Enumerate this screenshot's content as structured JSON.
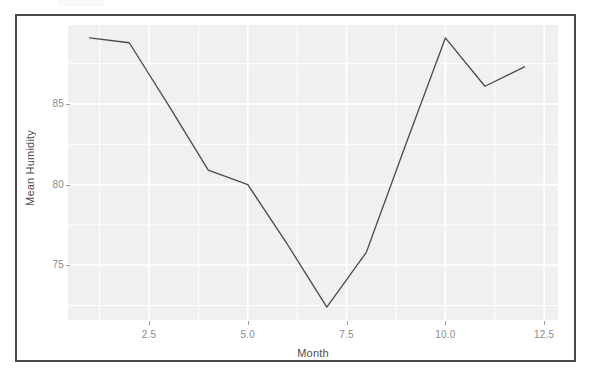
{
  "figure": {
    "panel_background": "#f0f0f0",
    "grid_color": "#ffffff",
    "line_color": "#4a4a4a",
    "frame_color": "#4a4a4a",
    "tick_text_color": "#8a8a8a",
    "axis_title_color": "#4d4d4d"
  },
  "chart_data": {
    "type": "line",
    "title": "",
    "xlabel": "Month",
    "ylabel": "Mean Humidity",
    "x": [
      1,
      2,
      3,
      4,
      5,
      6,
      7,
      8,
      9,
      10,
      11,
      12
    ],
    "values": [
      89.1,
      88.8,
      84.9,
      80.9,
      80.0,
      76.3,
      72.4,
      75.8,
      82.5,
      89.1,
      86.1,
      87.3
    ],
    "series": [
      {
        "name": "Mean Humidity",
        "values": [
          89.1,
          88.8,
          84.9,
          80.9,
          80.0,
          76.3,
          72.4,
          75.8,
          82.5,
          89.1,
          86.1,
          87.3
        ]
      }
    ],
    "xlim": [
      0.45,
      12.85
    ],
    "ylim": [
      71.6,
      89.9
    ],
    "xticks": [
      2.5,
      5.0,
      7.5,
      10.0,
      12.5
    ],
    "xtick_labels": [
      "2.5",
      "5.0",
      "7.5",
      "10.0",
      "12.5"
    ],
    "yticks": [
      75,
      80,
      85
    ],
    "ytick_labels": [
      "75",
      "80",
      "85"
    ],
    "grid": true,
    "grid_major_x": [
      2.5,
      5.0,
      7.5,
      10.0,
      12.5
    ],
    "grid_major_y": [
      75,
      80,
      85
    ],
    "grid_minor_x": [
      1.25,
      3.75,
      6.25,
      8.75,
      11.25
    ],
    "grid_minor_y": [
      72.5,
      77.5,
      82.5,
      87.5
    ],
    "legend": null,
    "legend_position": "none",
    "markers": false,
    "line_width": 1.3
  }
}
